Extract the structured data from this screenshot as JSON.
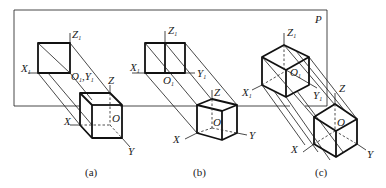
{
  "figure": {
    "plane_label": "P",
    "panels": [
      {
        "caption": "(a)",
        "projection_axes": {
          "x": "X",
          "y": "Y",
          "z": "Z",
          "o": "O",
          "sub": "1"
        },
        "space_axes": {
          "x": "X",
          "y": "Y",
          "z": "Z",
          "o": "O"
        }
      },
      {
        "caption": "(b)",
        "projection_axes": {
          "x": "X",
          "y": "Y",
          "z": "Z",
          "o": "O",
          "sub": "1"
        },
        "space_axes": {
          "x": "X",
          "y": "Y",
          "z": "Z",
          "o": "O"
        }
      },
      {
        "caption": "(c)",
        "projection_axes": {
          "x": "X",
          "y": "Y",
          "z": "Z",
          "o": "O",
          "sub": "1"
        },
        "space_axes": {
          "x": "X",
          "y": "Y",
          "z": "Z",
          "o": "O"
        }
      }
    ]
  }
}
